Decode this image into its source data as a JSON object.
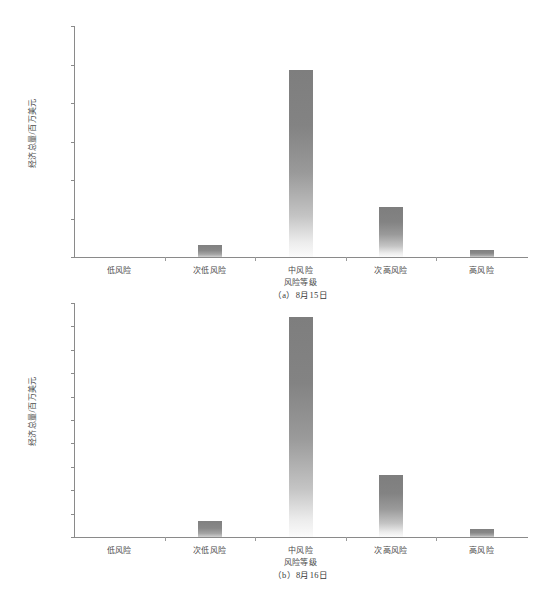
{
  "page": {
    "top_bleed_text": "                  "
  },
  "figure_a": {
    "caption": "（a）8月15日",
    "xlabel": "风险等级",
    "ylabel": "经济总量/百万美元",
    "categories": [
      "低风险",
      "次低风险",
      "中风险",
      "次高风险",
      "高风险"
    ],
    "ticklabels": [
      "0",
      "100 000",
      "200 000",
      "300 000",
      "400 000",
      "500 000",
      "600 000"
    ]
  },
  "figure_b": {
    "caption": "（b）8月16日",
    "xlabel": "风险等级",
    "ylabel": "经济总量/百万美元",
    "categories": [
      "低风险",
      "次低风险",
      "中风险",
      "次高风险",
      "高风险"
    ],
    "ticklabels": [
      "0",
      "50 000",
      "100 000",
      "150 000",
      "200 000",
      "250 000",
      "300 000",
      "350 000",
      "400 000",
      "450 000",
      "500 000"
    ]
  },
  "chart_data": [
    {
      "type": "bar",
      "title": "（a）8月15日",
      "xlabel": "风险等级",
      "ylabel": "经济总量/百万美元",
      "categories": [
        "低风险",
        "次低风险",
        "中风险",
        "次高风险",
        "高风险"
      ],
      "values": [
        0,
        31000,
        485000,
        129000,
        18000
      ],
      "ylim": [
        0,
        600000
      ],
      "ytick_step": 100000,
      "yticks": [
        0,
        100000,
        200000,
        300000,
        400000,
        500000,
        600000
      ],
      "grid": false,
      "legend": null,
      "bar_color": "#8a8a8a",
      "bar_gradient": [
        "#7e7e7e",
        "#fbfbfb"
      ]
    },
    {
      "type": "bar",
      "title": "（b）8月16日",
      "xlabel": "风险等级",
      "ylabel": "经济总量/百万美元",
      "categories": [
        "低风险",
        "次低风险",
        "中风险",
        "次高风险",
        "高风险"
      ],
      "values": [
        0,
        34000,
        471000,
        133000,
        17000
      ],
      "ylim": [
        0,
        500000
      ],
      "ytick_step": 50000,
      "yticks": [
        0,
        50000,
        100000,
        150000,
        200000,
        250000,
        300000,
        350000,
        400000,
        450000,
        500000
      ],
      "grid": false,
      "legend": null,
      "bar_color": "#8a8a8a",
      "bar_gradient": [
        "#7e7e7e",
        "#fbfbfb"
      ]
    }
  ]
}
